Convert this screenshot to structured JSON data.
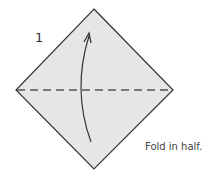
{
  "diagram": {
    "step_number": "1",
    "caption": "Fold in half.",
    "colors": {
      "paper_fill": "#e6e6e6",
      "paper_outline": "#333333",
      "fold_line": "#555555",
      "arrow": "#333333"
    },
    "shapes": {
      "square_paper": {
        "type": "diamond",
        "top": [
          94,
          9
        ],
        "right": [
          173,
          90
        ],
        "bottom": [
          94,
          169
        ],
        "left": [
          16,
          90
        ]
      },
      "valley_fold_line": {
        "type": "dashed-line",
        "from": [
          16,
          90
        ],
        "to": [
          173,
          90
        ]
      },
      "fold_arrow": {
        "type": "curved-arrow",
        "from": [
          91,
          142
        ],
        "to": [
          89,
          34
        ],
        "direction": "up"
      }
    }
  }
}
